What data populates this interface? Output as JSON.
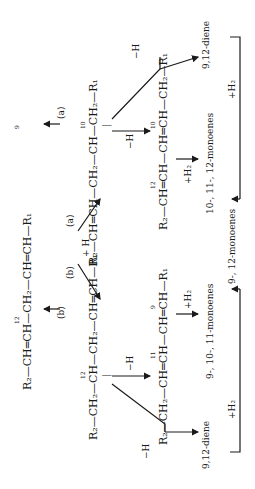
{
  "diagram": {
    "type": "reaction-scheme",
    "orientation": "rotated-90-ccw",
    "starting_material": {
      "formula": "R₂—CH═CH—CH₂—CH═CH—R₁",
      "positions": [
        "12",
        "9"
      ],
      "attack_labels": [
        "(b)",
        "(a)"
      ]
    },
    "step1": {
      "reagent": "+ H",
      "path_a_label": "(a)",
      "path_b_label": "(b)"
    },
    "radical_a": {
      "formula": "R₂—CH═CH—CH₂—CH—CH₂—R₁",
      "position": "10",
      "radical_mark": "|"
    },
    "radical_b": {
      "formula": "R₂—CH₂—CH—CH₂—CH═CH—R₁",
      "position": "12",
      "radical_mark": "|"
    },
    "conjugated_a": {
      "formula": "R₂—CH═CH—CH═CH—CH₂—R₁",
      "positions": [
        "12",
        "10"
      ],
      "reagent_in": "−H",
      "reagent_out": "+H₂",
      "product": "10-, 11-, 12-monoenes"
    },
    "conjugated_b": {
      "formula": "R₂—CH₂—CH═CH—CH═CH—R₁",
      "positions": [
        "11",
        "9"
      ],
      "reagent_in": "−H",
      "reagent_out": "+H₂",
      "product": "9-, 10-, 11-monoenes"
    },
    "diene_a": {
      "label": "9,12-diene",
      "reagent_in": "−H",
      "reagent_out": "+H₂"
    },
    "diene_b": {
      "label": "9,12-diene",
      "reagent_in": "−H",
      "reagent_out": "+H₂"
    },
    "final_product": "9-, 12-monoenes"
  },
  "labels": {
    "start_R2": "R₂—CH═CH—CH₂—CH═CH—R₁",
    "num12_start": "12",
    "num9_start": "9",
    "attack_b": "(b)",
    "attack_a": "(a)",
    "plusH": "+ H",
    "path_a": "(a)",
    "path_b": "(b)",
    "radA": "R₂—CH═CH—CH₂—CH—CH₂—R₁",
    "radA_num": "10",
    "radB": "R₂—CH₂—CH—CH₂—CH═CH—R₁",
    "radB_num": "12",
    "radical_bar": "|",
    "minusH": "−H",
    "plusH2": "+H₂",
    "conjA": "R₂—CH═CH—CH═CH—CH₂—R₁",
    "conjA_num12": "12",
    "conjA_num10": "10",
    "conjB": "R₂—CH₂—CH═CH—CH═CH—R₁",
    "conjB_num11": "11",
    "conjB_num9": "9",
    "monoA": "10-, 11-, 12-monoenes",
    "monoB": "9-, 10-, 11-monoenes",
    "dieneA": "9,12-diene",
    "dieneB": "9,12-diene",
    "final": "9-, 12-monoenes"
  }
}
